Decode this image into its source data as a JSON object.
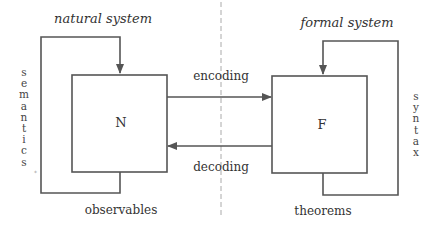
{
  "diagram": {
    "headings": {
      "left": "natural system",
      "right": "formal system"
    },
    "boxes": {
      "natural": "N",
      "formal": "F"
    },
    "arrows": {
      "encoding": "encoding",
      "decoding": "decoding"
    },
    "loops": {
      "left_side_label": "semantics",
      "left_bottom_label": "observables",
      "right_side_label": "syntax",
      "right_bottom_label": "theorems"
    },
    "left_side_letters": [
      "s",
      "e",
      "m",
      "a",
      "n",
      "t",
      "i",
      "c",
      "s"
    ],
    "right_side_letters": [
      "s",
      "y",
      "n",
      "t",
      "a",
      "x"
    ],
    "colors": {
      "line": "#555555",
      "dashed_divider": "#aaaaaa",
      "text": "#333333"
    }
  }
}
